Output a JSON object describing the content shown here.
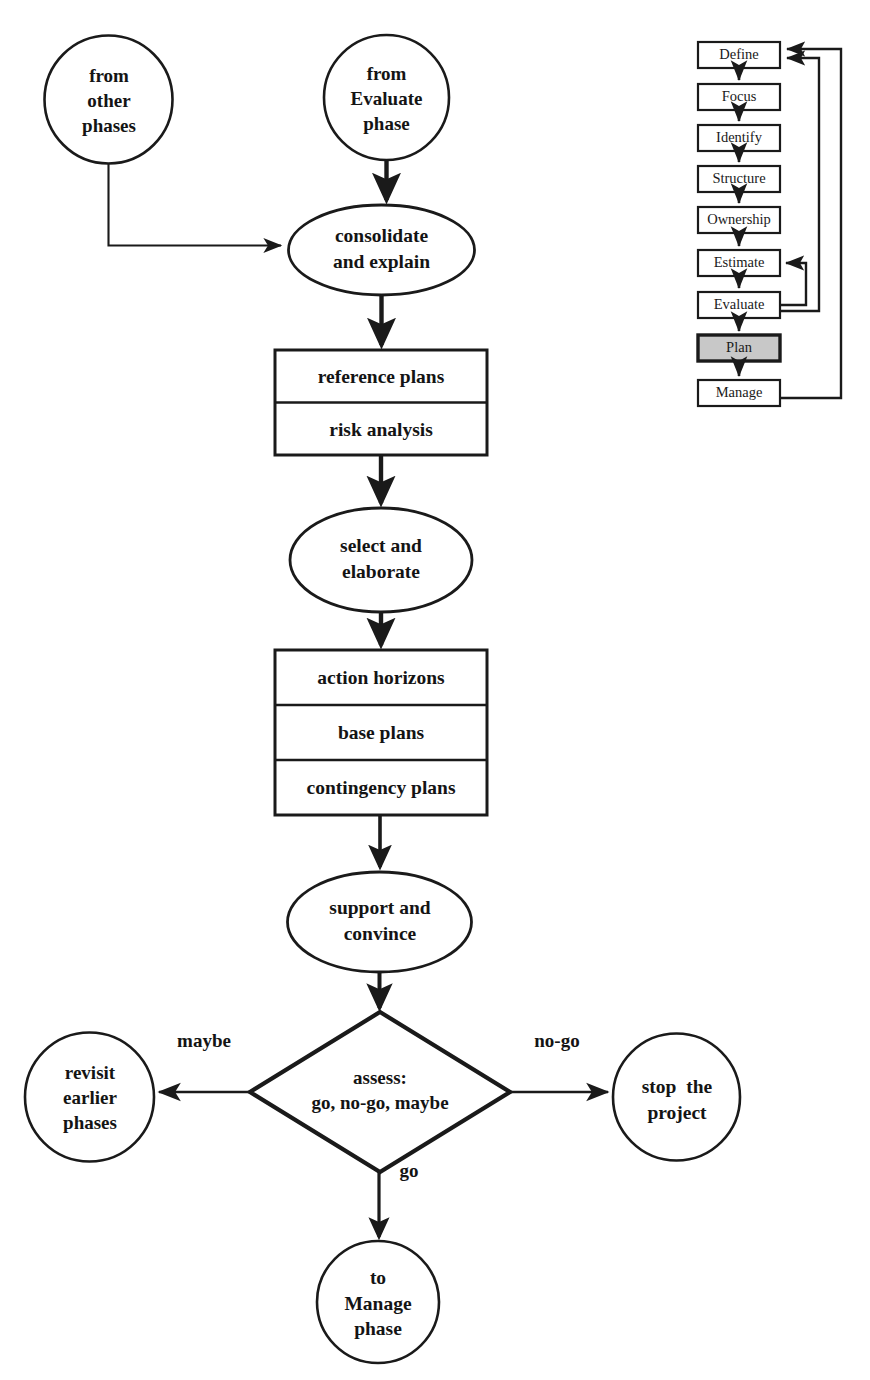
{
  "diagram": {
    "stroke_color": "#1a1a1a",
    "fill_color": "#ffffff",
    "highlight_color": "#c8c8c8"
  },
  "main_flow": {
    "nodes": [
      {
        "id": "from-other-phases",
        "shape": "circle",
        "text": "from\nother\nphases"
      },
      {
        "id": "from-evaluate-phase",
        "shape": "circle",
        "text": "from\nEvaluate\nphase"
      },
      {
        "id": "consolidate-and-explain",
        "shape": "ellipse",
        "text": "consolidate\nand explain"
      },
      {
        "id": "select-and-elaborate",
        "shape": "ellipse",
        "text": "select and\nelaborate"
      },
      {
        "id": "support-and-convince",
        "shape": "ellipse",
        "text": "support and\nconvince"
      },
      {
        "id": "assess-decision",
        "shape": "diamond",
        "text": "assess:\ngo, no-go, maybe"
      },
      {
        "id": "revisit-earlier-phases",
        "shape": "circle",
        "text": "revisit\nearlier\nphases"
      },
      {
        "id": "stop-the-project",
        "shape": "circle",
        "text": "stop  the\nproject"
      },
      {
        "id": "to-manage-phase",
        "shape": "circle",
        "text": "to\nManage\nphase"
      }
    ],
    "artifact_box_1": {
      "id": "plans-box-1",
      "rows": [
        "reference plans",
        "risk analysis"
      ]
    },
    "artifact_box_2": {
      "id": "plans-box-2",
      "rows": [
        "action horizons",
        "base plans",
        "contingency plans"
      ]
    },
    "edge_labels": [
      {
        "id": "maybe",
        "text": "maybe"
      },
      {
        "id": "no-go",
        "text": "no-go"
      },
      {
        "id": "go",
        "text": "go"
      }
    ]
  },
  "mini_process": {
    "steps": [
      {
        "id": "define",
        "label": "Define",
        "highlighted": false
      },
      {
        "id": "focus",
        "label": "Focus",
        "highlighted": false
      },
      {
        "id": "identify",
        "label": "Identify",
        "highlighted": false
      },
      {
        "id": "structure",
        "label": "Structure",
        "highlighted": false
      },
      {
        "id": "ownership",
        "label": "Ownership",
        "highlighted": false
      },
      {
        "id": "estimate",
        "label": "Estimate",
        "highlighted": false
      },
      {
        "id": "evaluate",
        "label": "Evaluate",
        "highlighted": false
      },
      {
        "id": "plan",
        "label": "Plan",
        "highlighted": true
      },
      {
        "id": "manage",
        "label": "Manage",
        "highlighted": false
      }
    ]
  }
}
